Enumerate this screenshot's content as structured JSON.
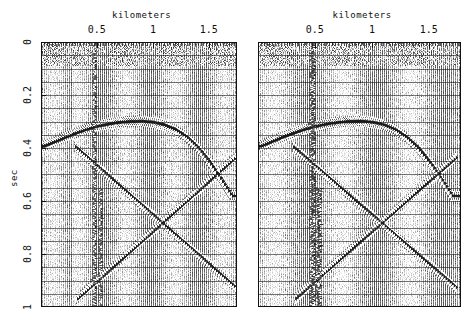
{
  "figure": {
    "width": 475,
    "height": 329,
    "background": "#ffffff",
    "ink": "#111111"
  },
  "panels": [
    {
      "id": "left-panel",
      "name": "seismic-section-left",
      "frame": {
        "x": 41,
        "y": 42,
        "width": 196,
        "height": 265
      },
      "xaxis": {
        "title": "kilometers",
        "title_pos": "top",
        "min": 0.0,
        "max": 1.75,
        "ticks": [
          0.5,
          1,
          1.5
        ],
        "tick_labels": [
          "0.5",
          "1",
          "1.5"
        ],
        "minor_tick_step": 0.025
      },
      "yaxis": {
        "title": "sec",
        "min": 0.0,
        "max": 1.0,
        "ticks": [
          0,
          0.2,
          0.4,
          0.6,
          0.8,
          1
        ],
        "tick_labels": [
          "0",
          "0.2",
          "0.4",
          "0.6",
          "0.8",
          "1"
        ],
        "gridline_step": 0.05,
        "direction": "down"
      }
    },
    {
      "id": "right-panel",
      "name": "seismic-section-right",
      "frame": {
        "x": 258,
        "y": 42,
        "width": 203,
        "height": 265
      },
      "xaxis": {
        "title": "kilometers",
        "title_pos": "top",
        "min": 0.0,
        "max": 1.78,
        "ticks": [
          0.5,
          1,
          1.5
        ],
        "tick_labels": [
          "0.5",
          "1",
          "1.5"
        ],
        "minor_tick_step": 0.025
      },
      "yaxis": {
        "title": "",
        "min": 0.0,
        "max": 1.0,
        "ticks": [],
        "tick_labels": [],
        "gridline_step": 0.05,
        "direction": "down"
      }
    }
  ],
  "chart_data": {
    "type": "line",
    "title": "",
    "subtitle": "",
    "xlabel": "kilometers",
    "ylabel": "sec",
    "xlim": [
      0.0,
      1.75
    ],
    "ylim": [
      1.0,
      0.0
    ],
    "grid": true,
    "legend": "none",
    "plot_style": "seismic wiggle-trace variable-area display",
    "trace_count": 100,
    "panels": [
      "left",
      "right"
    ],
    "events": [
      {
        "name": "anticline-reflector",
        "kind": "arched reflection",
        "description": "Strong dark arch peaking near 0.9 km at 0.30 s, dipping to 0.39 s at left edge and to ~0.50 s toward 1.5 km",
        "points_km_sec": [
          [
            0.02,
            0.392
          ],
          [
            0.1,
            0.378
          ],
          [
            0.2,
            0.36
          ],
          [
            0.3,
            0.344
          ],
          [
            0.4,
            0.329
          ],
          [
            0.5,
            0.317
          ],
          [
            0.6,
            0.308
          ],
          [
            0.7,
            0.302
          ],
          [
            0.8,
            0.299
          ],
          [
            0.9,
            0.298
          ],
          [
            1.0,
            0.302
          ],
          [
            1.1,
            0.312
          ],
          [
            1.2,
            0.33
          ],
          [
            1.3,
            0.358
          ],
          [
            1.4,
            0.398
          ],
          [
            1.5,
            0.45
          ],
          [
            1.6,
            0.512
          ],
          [
            1.7,
            0.58
          ]
        ]
      },
      {
        "name": "diffraction-limb-down-right",
        "kind": "linear event dipping down to the right",
        "description": "Straight event from about 0.30 km at 0.39 s down to 1.75 km at 0.93 s",
        "points_km_sec": [
          [
            0.3,
            0.392
          ],
          [
            1.75,
            0.93
          ]
        ]
      },
      {
        "name": "diffraction-limb-up-right",
        "kind": "linear event dipping up to the right",
        "description": "Straight event from about 0.32 km at 0.97 s up to 1.75 km at 0.43 s crossing the other limb near 1.22 km / 0.55 s",
        "points_km_sec": [
          [
            0.32,
            0.97
          ],
          [
            1.75,
            0.43
          ]
        ]
      },
      {
        "name": "crossing-point",
        "kind": "annotation",
        "description": "The two linear limbs cross near 1.22 km, 0.55 s",
        "points_km_sec": [
          [
            1.22,
            0.55
          ]
        ]
      },
      {
        "name": "noise-burst-a",
        "kind": "vertical high-amplitude trace",
        "description": "Strong vertical noise streak near 0.48 km spanning 0.0 - 1.0 s",
        "points_km_sec": [
          [
            0.48,
            0.0
          ],
          [
            0.48,
            1.0
          ]
        ]
      },
      {
        "name": "noise-burst-b",
        "kind": "vertical high-amplitude trace",
        "description": "Strong vertical noise streak near 0.53 km spanning 0.55 - 1.0 s",
        "points_km_sec": [
          [
            0.53,
            0.55
          ],
          [
            0.53,
            1.0
          ]
        ]
      }
    ]
  }
}
